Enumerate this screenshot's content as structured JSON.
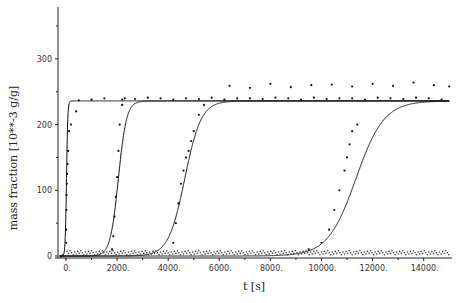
{
  "chart_data": {
    "type": "line",
    "title": "",
    "xlabel": "t [s]",
    "ylabel": "mass fraction [10**-3 g/g]",
    "xlim": [
      -300,
      15100
    ],
    "ylim": [
      0,
      380
    ],
    "x_ticks": [
      0,
      2000,
      4000,
      6000,
      8000,
      10000,
      12000,
      14000
    ],
    "x_tick_labels": [
      "0.",
      "2000.",
      "4000.",
      "6000.",
      "8000.",
      "10000.",
      "12000.",
      "14000."
    ],
    "y_ticks": [
      0,
      100,
      200,
      300
    ],
    "y_tick_labels": [
      "0",
      "100",
      "200",
      "300"
    ],
    "grid": false,
    "legend": null,
    "series": [
      {
        "name": "model curve 1",
        "style": "line",
        "midpoint_t": 20,
        "width_t": 25,
        "plateau": 236
      },
      {
        "name": "model curve 2",
        "style": "line",
        "midpoint_t": 2050,
        "width_t": 160,
        "plateau": 236
      },
      {
        "name": "model curve 3",
        "style": "line",
        "midpoint_t": 4650,
        "width_t": 320,
        "plateau": 236
      },
      {
        "name": "model curve 4",
        "style": "line",
        "midpoint_t": 11350,
        "width_t": 550,
        "plateau": 236
      },
      {
        "name": "measured points plateau",
        "style": "points",
        "x": [
          500,
          1000,
          1500,
          2200,
          2700,
          3200,
          3700,
          4200,
          4700,
          5200,
          5700,
          6200,
          6700,
          7200,
          7700,
          8200,
          8700,
          9200,
          9700,
          10200,
          10700,
          11200,
          11700,
          12200,
          12700,
          13200,
          13700,
          14200,
          14700
        ],
        "y": [
          237,
          238,
          240,
          238,
          239,
          241,
          240,
          238,
          240,
          239,
          241,
          238,
          240,
          240,
          239,
          241,
          240,
          238,
          241,
          239,
          240,
          240,
          238,
          241,
          240,
          239,
          241,
          240,
          238
        ]
      },
      {
        "name": "measured points upper",
        "style": "points",
        "x": [
          6400,
          7200,
          8000,
          8800,
          9600,
          10400,
          11200,
          12000,
          12800,
          13600,
          14400,
          15000
        ],
        "y": [
          259,
          256,
          262,
          257,
          260,
          261,
          258,
          262,
          259,
          264,
          260,
          258
        ]
      },
      {
        "name": "measured rise 1",
        "style": "points",
        "x": [
          5,
          10,
          15,
          20,
          30,
          40,
          60,
          80,
          120,
          200,
          400
        ],
        "y": [
          20,
          40,
          70,
          93,
          110,
          125,
          140,
          160,
          190,
          200,
          220
        ]
      },
      {
        "name": "measured rise 2",
        "style": "points",
        "x": [
          1800,
          1850,
          1900,
          1950,
          2000,
          2050,
          2100,
          2200,
          2300
        ],
        "y": [
          10,
          30,
          60,
          90,
          120,
          160,
          200,
          230,
          240
        ]
      },
      {
        "name": "measured rise 3",
        "style": "points",
        "x": [
          4200,
          4300,
          4400,
          4500,
          4600,
          4700,
          4800,
          4900,
          5000,
          5200,
          5400
        ],
        "y": [
          20,
          50,
          80,
          110,
          130,
          150,
          160,
          175,
          190,
          215,
          230
        ]
      },
      {
        "name": "measured rise 4",
        "style": "points",
        "x": [
          9500,
          10000,
          10300,
          10500,
          10700,
          10900,
          11000,
          11100,
          11200,
          11400
        ],
        "y": [
          10,
          20,
          40,
          70,
          100,
          130,
          150,
          170,
          190,
          200
        ]
      }
    ]
  },
  "axes": {
    "x_title": "t [s]",
    "y_title": "mass fraction [10**-3 g/g]"
  }
}
